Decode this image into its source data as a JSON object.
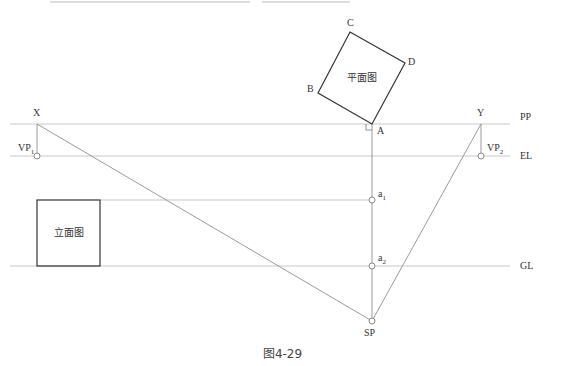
{
  "figure": {
    "caption": "图4-29",
    "plan_label": "平面图",
    "elevation_label": "立面图",
    "lines": {
      "pp": "PP",
      "el": "EL",
      "gl": "GL"
    },
    "points": {
      "a": "A",
      "b": "B",
      "c": "C",
      "d": "D",
      "x": "X",
      "y": "Y",
      "sp": "SP",
      "vp1_base": "VP",
      "vp1_sub": "1",
      "vp2_base": "VP",
      "vp2_sub": "2",
      "a1_base": "a",
      "a1_sub": "1",
      "a2_base": "a",
      "a2_sub": "2"
    },
    "colors": {
      "guide_line": "#c8c8c8",
      "construction_line": "#9a9a9a",
      "outline": "#333333"
    }
  }
}
